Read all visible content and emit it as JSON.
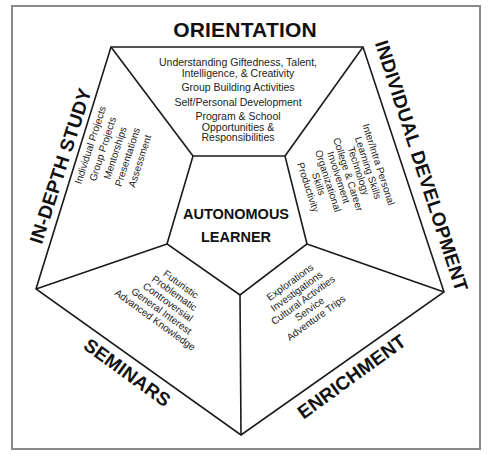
{
  "diagram": {
    "center": {
      "line1": "AUTONOMOUS",
      "line2": "LEARNER"
    },
    "sections": {
      "orientation": {
        "title": "ORIENTATION",
        "items": [
          "Understanding Giftedness, Talent,",
          "Intelligence, & Creativity",
          "Group Building Activities",
          "Self/Personal Development",
          "Program & School",
          "Opportunities &",
          "Responsibilities"
        ]
      },
      "individual_development": {
        "title": "INDIVIDUAL DEVELOPMENT",
        "items": [
          "Inter/Intra Personal",
          "Learning Skills",
          "Technology",
          "College & Career",
          "Involvement",
          "Organizational",
          "Skills",
          "Productivity"
        ]
      },
      "enrichment": {
        "title": "ENRICHMENT",
        "items": [
          "Explorations",
          "Investigations",
          "Cultural Activities",
          "Service",
          "Adventure Trips"
        ]
      },
      "seminars": {
        "title": "SEMINARS",
        "items": [
          "Futuristic",
          "Problematic",
          "Controversial",
          "General Interest",
          "Advanced Knowledge"
        ]
      },
      "in_depth_study": {
        "title": "IN-DEPTH STUDY",
        "items": [
          "Individual Projects",
          "Group Projects",
          "Mentorships",
          "Presentations",
          "Assessment"
        ]
      }
    },
    "colors": {
      "line": "#1a1a1a",
      "frame": "#8a8a8a",
      "background": "#ffffff"
    }
  }
}
